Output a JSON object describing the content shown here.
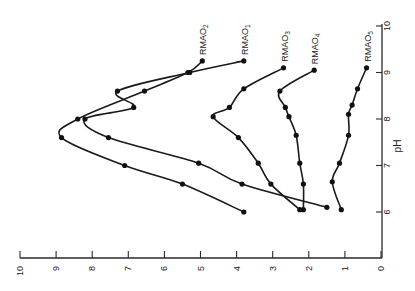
{
  "chart_data": {
    "type": "line",
    "title": "",
    "orientation_note": "figure printed rotated 90 degrees clockwise",
    "xlabel": "pH",
    "ylabel": "",
    "xlim": [
      0,
      10
    ],
    "ylim": [
      0,
      10
    ],
    "x_ticks": [
      "6",
      "7",
      "8",
      "9",
      "10"
    ],
    "y_ticks": [
      "0",
      "1",
      "2",
      "3",
      "4",
      "5",
      "6",
      "7",
      "8",
      "9",
      "10"
    ],
    "grid": false,
    "legend_position": "inline labels at curve ends",
    "series": [
      {
        "name": "RMAO2",
        "label_main": "RMAO",
        "label_sub": "2",
        "x": [
          6.0,
          6.6,
          7.0,
          7.6,
          8.0,
          8.6,
          9.0,
          9.25
        ],
        "y": [
          3.8,
          5.5,
          7.1,
          8.85,
          8.4,
          6.55,
          5.35,
          4.95
        ]
      },
      {
        "name": "RMAO1",
        "label_main": "RMAO",
        "label_sub": "1",
        "x": [
          6.1,
          6.6,
          7.05,
          7.6,
          8.0,
          8.25,
          8.6,
          9.0,
          9.25
        ],
        "y": [
          1.5,
          3.85,
          5.05,
          7.55,
          8.2,
          6.85,
          7.3,
          5.3,
          3.8
        ]
      },
      {
        "name": "RMAO3",
        "label_main": "RMAO",
        "label_sub": "3",
        "x": [
          6.05,
          6.6,
          7.05,
          7.6,
          8.05,
          8.25,
          8.65,
          9.1
        ],
        "y": [
          2.25,
          3.05,
          3.4,
          3.95,
          4.65,
          4.2,
          3.8,
          2.7
        ]
      },
      {
        "name": "RMAO4",
        "label_main": "RMAO",
        "label_sub": "4",
        "x": [
          6.05,
          6.6,
          7.05,
          7.65,
          8.05,
          8.25,
          8.6,
          9.05
        ],
        "y": [
          2.15,
          2.15,
          2.25,
          2.35,
          2.55,
          2.65,
          2.8,
          1.85
        ]
      },
      {
        "name": "RMAO5",
        "label_main": "RMAO",
        "label_sub": "5",
        "x": [
          6.05,
          6.65,
          7.05,
          7.65,
          8.1,
          8.3,
          8.65,
          9.1
        ],
        "y": [
          1.1,
          1.35,
          1.15,
          0.9,
          0.9,
          0.8,
          0.65,
          0.4
        ]
      }
    ]
  },
  "axes": {
    "ph_label": "pH",
    "origin_label": "0"
  }
}
